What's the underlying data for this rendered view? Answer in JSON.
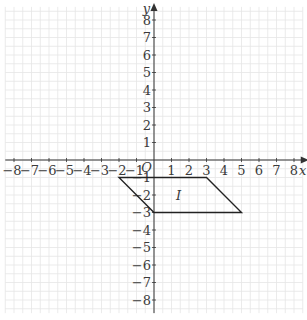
{
  "chart_data": {
    "type": "coordinate-grid",
    "title": "",
    "xlabel": "x",
    "ylabel": "y",
    "origin_label": "O",
    "xlim": [
      -8.5,
      8.5
    ],
    "ylim": [
      -8.75,
      8.75
    ],
    "grid": true,
    "x_ticks": [
      -8,
      -7,
      -6,
      -5,
      -4,
      -3,
      -2,
      -1,
      1,
      2,
      3,
      4,
      5,
      6,
      7,
      8
    ],
    "y_ticks": [
      -8,
      -7,
      -6,
      -5,
      -4,
      -3,
      -2,
      -1,
      1,
      2,
      3,
      4,
      5,
      6,
      7,
      8
    ],
    "shapes": [
      {
        "name": "I",
        "type": "parallelogram",
        "vertices": [
          [
            -2,
            -1
          ],
          [
            3,
            -1
          ],
          [
            5,
            -3
          ],
          [
            0,
            -3
          ]
        ],
        "label_position": [
          1.4,
          -2
        ]
      }
    ]
  },
  "layout": {
    "origin_px": [
      154,
      160
    ],
    "unit_px": 17.5,
    "colors": {
      "grid": "#e6e6e6",
      "axis": "#333333",
      "shape": "#222222"
    }
  }
}
